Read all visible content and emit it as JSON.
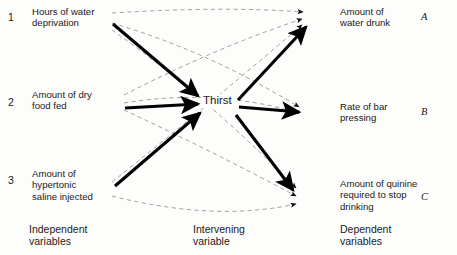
{
  "diagram": {
    "colors": {
      "solid_line": "#000000",
      "dashed_line": "#8a8a8a",
      "text": "#1a1a1a",
      "background": "#fdfdfc"
    },
    "independent": {
      "group_label": "Independent\nvariables",
      "items": [
        {
          "number": "1",
          "label": "Hours of water\ndeprivation"
        },
        {
          "number": "2",
          "label": "Amount of dry\nfood fed"
        },
        {
          "number": "3",
          "label": "Amount of\nhypertonic\nsaline injected"
        }
      ]
    },
    "intervening": {
      "group_label": "Intervening\nvariable",
      "items": [
        {
          "label": "Thirst"
        }
      ]
    },
    "dependent": {
      "group_label": "Dependent\nvariables",
      "items": [
        {
          "marker": "A",
          "label": "Amount of\nwater drunk"
        },
        {
          "marker": "B",
          "label": "Rate of bar\npressing"
        },
        {
          "marker": "C",
          "label": "Amount of quinine\nrequired to stop\ndrinking"
        }
      ]
    },
    "edges": {
      "solid_in": [
        {
          "from": "1",
          "to": "Thirst"
        },
        {
          "from": "2",
          "to": "Thirst"
        },
        {
          "from": "3",
          "to": "Thirst"
        }
      ],
      "solid_out": [
        {
          "from": "Thirst",
          "to": "A"
        },
        {
          "from": "Thirst",
          "to": "B"
        },
        {
          "from": "Thirst",
          "to": "C"
        }
      ],
      "dashed_direct": [
        {
          "from": "1",
          "to": "A"
        },
        {
          "from": "1",
          "to": "B"
        },
        {
          "from": "1",
          "to": "C"
        },
        {
          "from": "2",
          "to": "A"
        },
        {
          "from": "2",
          "to": "B"
        },
        {
          "from": "2",
          "to": "C"
        },
        {
          "from": "3",
          "to": "A"
        },
        {
          "from": "3",
          "to": "C"
        }
      ]
    }
  }
}
